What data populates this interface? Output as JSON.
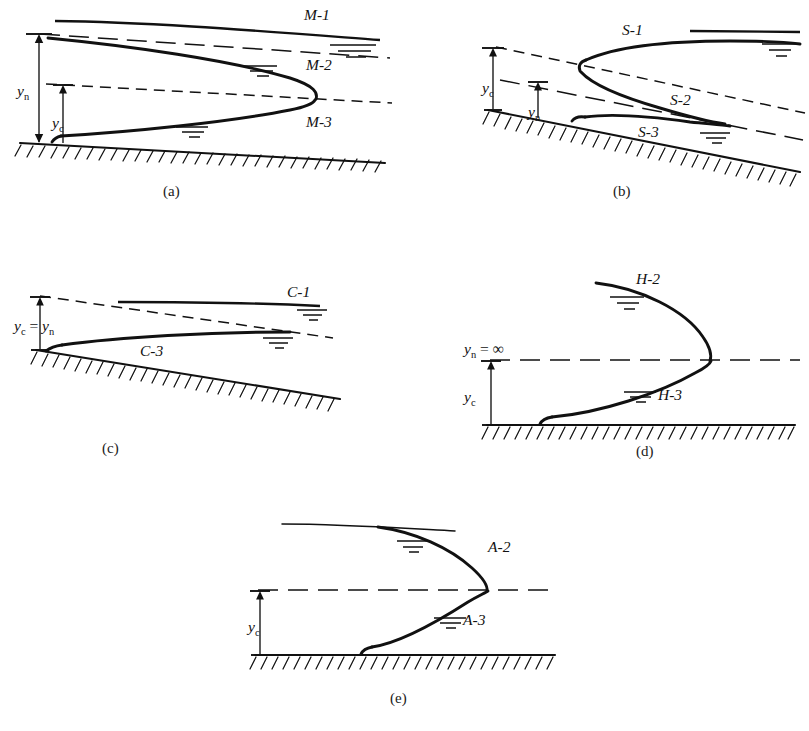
{
  "figure": {
    "panels": [
      {
        "id": "a",
        "caption": "(a)",
        "slope_type": "mild",
        "curve_labels": [
          "M-1",
          "M-2",
          "M-3"
        ],
        "depth_labels": [
          "y",
          "y"
        ],
        "depth_subscripts": [
          "n",
          "c"
        ],
        "dimension_lines": [
          "y_n",
          "y_c"
        ]
      },
      {
        "id": "b",
        "caption": "(b)",
        "slope_type": "steep",
        "curve_labels": [
          "S-1",
          "S-2",
          "S-3"
        ],
        "depth_labels": [
          "y",
          "y"
        ],
        "depth_subscripts": [
          "c",
          "n"
        ],
        "dimension_lines": [
          "y_c",
          "y_n"
        ]
      },
      {
        "id": "c",
        "caption": "(c)",
        "slope_type": "critical",
        "curve_labels": [
          "C-1",
          "C-3"
        ],
        "depth_labels": [
          "y",
          "y"
        ],
        "depth_subscripts": [
          "c",
          "n"
        ],
        "equality_symbol": "=",
        "dimension_lines": [
          "y_c = y_n"
        ]
      },
      {
        "id": "d",
        "caption": "(d)",
        "slope_type": "horizontal",
        "curve_labels": [
          "H-2",
          "H-3"
        ],
        "depth_labels": [
          "y",
          "y"
        ],
        "depth_subscripts": [
          "n",
          "c"
        ],
        "infinity_symbol": "∞",
        "equality_symbol": "=",
        "dimension_lines": [
          "y_n = ∞",
          "y_c"
        ]
      },
      {
        "id": "e",
        "caption": "(e)",
        "slope_type": "adverse",
        "curve_labels": [
          "A-2",
          "A-3"
        ],
        "depth_labels": [
          "y"
        ],
        "depth_subscripts": [
          "c"
        ],
        "dimension_lines": [
          "y_c"
        ]
      }
    ],
    "labels": {
      "m1": "M-1",
      "m2": "M-2",
      "m3": "M-3",
      "s1": "S-1",
      "s2": "S-2",
      "s3": "S-3",
      "c1": "C-1",
      "c3": "C-3",
      "h2": "H-2",
      "h3": "H-3",
      "a2": "A-2",
      "a3": "A-3",
      "y": "y",
      "sub_n": "n",
      "sub_c": "c",
      "eq": "=",
      "inf": "∞",
      "cap_a": "(a)",
      "cap_b": "(b)",
      "cap_c": "(c)",
      "cap_d": "(d)",
      "cap_e": "(e)"
    },
    "colors": {
      "ink": "#111111",
      "background": "#ffffff"
    }
  }
}
